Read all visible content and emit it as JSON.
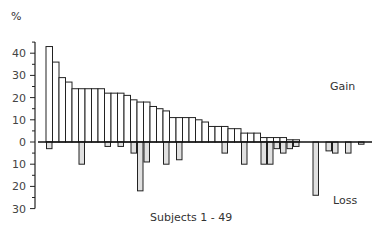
{
  "chart_data": {
    "type": "bar",
    "title": "",
    "xlabel": "Subjects 1 - 49",
    "ylabel": "%",
    "ylim": [
      -30,
      45
    ],
    "y_ticks": [
      40,
      30,
      20,
      10,
      0,
      10,
      20,
      30
    ],
    "grid": false,
    "annotations": [
      "Gain",
      "Loss"
    ],
    "categories": [
      "1",
      "2",
      "3",
      "4",
      "5",
      "6",
      "7",
      "8",
      "9",
      "10",
      "11",
      "12",
      "13",
      "14",
      "15",
      "16",
      "17",
      "18",
      "19",
      "20",
      "21",
      "22",
      "23",
      "24",
      "25",
      "26",
      "27",
      "28",
      "29",
      "30",
      "31",
      "32",
      "33",
      "34",
      "35",
      "36",
      "37",
      "38",
      "39",
      "40",
      "41",
      "42",
      "43",
      "44",
      "45",
      "46",
      "47",
      "48",
      "49"
    ],
    "series": [
      {
        "name": "Gain",
        "color": "#ffffff",
        "values": [
          43,
          36,
          29,
          27,
          24,
          24,
          24,
          24,
          24,
          22,
          22,
          22,
          21,
          19,
          18,
          18,
          16,
          15,
          14,
          11,
          11,
          11,
          11,
          10,
          9,
          7,
          7,
          7,
          6,
          6,
          4,
          4,
          4,
          2,
          2,
          2,
          2,
          1,
          1,
          0,
          0,
          0,
          0,
          0,
          0,
          0,
          0,
          0,
          0
        ]
      },
      {
        "name": "Loss",
        "color": "#e0e0e0",
        "values": [
          3,
          0,
          0,
          0,
          0,
          10,
          0,
          0,
          0,
          2,
          0,
          2,
          0,
          5,
          22,
          9,
          0,
          0,
          10,
          0,
          8,
          0,
          0,
          0,
          0,
          0,
          0,
          5,
          0,
          0,
          10,
          0,
          0,
          10,
          10,
          3,
          5,
          3,
          2,
          0,
          0,
          24,
          0,
          4,
          5,
          0,
          5,
          0,
          1
        ]
      }
    ]
  },
  "labels": {
    "y_unit": "%",
    "gain": "Gain",
    "loss": "Loss",
    "x_axis": "Subjects 1 - 49",
    "y_tick_labels": [
      "40",
      "30",
      "20",
      "10",
      "0",
      "10",
      "20",
      "30"
    ]
  }
}
